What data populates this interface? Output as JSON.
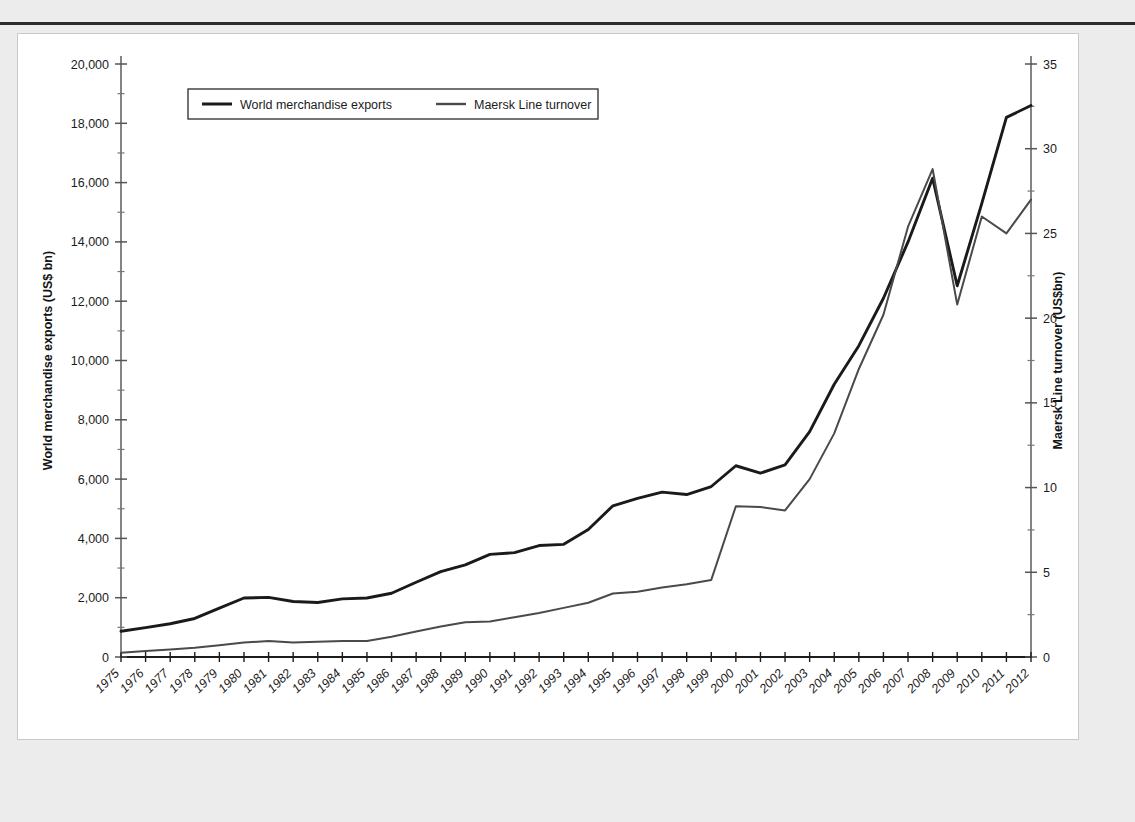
{
  "figure": {
    "background_color": "#ffffff",
    "page_background_color": "#ececec",
    "rule_color": "#2b2b2b"
  },
  "legend": {
    "position": "top-left-inside",
    "entries": [
      {
        "label": "World merchandise exports",
        "color": "#1a1a1a",
        "width": 2.6,
        "icon": "line-swatch-icon"
      },
      {
        "label": "Maersk Line turnover",
        "color": "#4a4a4a",
        "width": 2.0,
        "icon": "line-swatch-icon"
      }
    ]
  },
  "axes": {
    "left": {
      "title": "World merchandise exports (US$ bn)",
      "min": 0,
      "max": 20000,
      "step": 2000,
      "ticks": [
        "0",
        "2,000",
        "4,000",
        "6,000",
        "8,000",
        "10,000",
        "12,000",
        "14,000",
        "16,000",
        "18,000",
        "20,000"
      ]
    },
    "right": {
      "title": "Maersk Line turnover (US$bn)",
      "min": 0,
      "max": 35,
      "step": 5,
      "ticks": [
        "0",
        "5",
        "10",
        "15",
        "20",
        "25",
        "30",
        "35"
      ]
    },
    "bottom": {
      "title": "",
      "label_rotation": -45,
      "ticks": [
        "1975",
        "1976",
        "1977",
        "1978",
        "1979",
        "1980",
        "1981",
        "1982",
        "1983",
        "1984",
        "1985",
        "1986",
        "1987",
        "1988",
        "1989",
        "1990",
        "1991",
        "1992",
        "1993",
        "1994",
        "1995",
        "1996",
        "1997",
        "1998",
        "1999",
        "2000",
        "2001",
        "2002",
        "2003",
        "2004",
        "2005",
        "2006",
        "2007",
        "2008",
        "2009",
        "2010",
        "2011",
        "2012"
      ]
    }
  },
  "chart_data": {
    "type": "line",
    "title": "",
    "subtitle": "",
    "xlabel": "",
    "ylabel": "World merchandise exports (US$ bn)",
    "ylabel_secondary": "Maersk Line turnover (US$bn)",
    "grid": false,
    "legend_position": "upper left",
    "x": [
      1975,
      1976,
      1977,
      1978,
      1979,
      1980,
      1981,
      1982,
      1983,
      1984,
      1985,
      1986,
      1987,
      1988,
      1989,
      1990,
      1991,
      1992,
      1993,
      1994,
      1995,
      1996,
      1997,
      1998,
      1999,
      2000,
      2001,
      2002,
      2003,
      2004,
      2005,
      2006,
      2007,
      2008,
      2009,
      2010,
      2011,
      2012
    ],
    "ylim": [
      0,
      20000
    ],
    "ylim_secondary": [
      0,
      35
    ],
    "series": [
      {
        "name": "World merchandise exports",
        "axis": "left",
        "units": "US$ bn",
        "color": "#1a1a1a",
        "values": [
          870,
          990,
          1120,
          1300,
          1650,
          1990,
          2010,
          1870,
          1840,
          1960,
          1990,
          2150,
          2520,
          2880,
          3110,
          3460,
          3520,
          3760,
          3800,
          4300,
          5100,
          5350,
          5560,
          5480,
          5750,
          6450,
          6200,
          6480,
          7600,
          9200,
          10500,
          12100,
          14000,
          16150,
          12520,
          15300,
          18200,
          18600
        ]
      },
      {
        "name": "Maersk Line turnover",
        "axis": "right",
        "units": "US$bn",
        "color": "#4a4a4a",
        "values": [
          0.25,
          0.35,
          0.45,
          0.55,
          0.7,
          0.85,
          0.95,
          0.85,
          0.9,
          0.95,
          0.95,
          1.2,
          1.5,
          1.8,
          2.05,
          2.1,
          2.35,
          2.6,
          2.9,
          3.2,
          3.75,
          3.85,
          4.1,
          4.3,
          4.55,
          8.9,
          8.85,
          8.65,
          10.5,
          13.2,
          17.0,
          20.2,
          25.4,
          28.8,
          20.8,
          26.0,
          25.0,
          27.0
        ]
      }
    ]
  }
}
